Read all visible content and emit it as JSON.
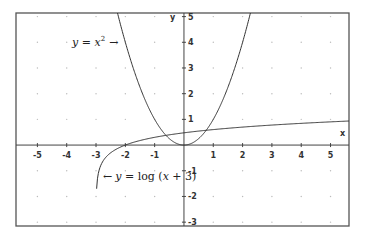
{
  "chart_data": {
    "type": "line",
    "title": "",
    "xlabel": "x",
    "ylabel": "y",
    "xlim": [
      -5.73,
      5.63
    ],
    "ylim": [
      -3.15,
      5.14
    ],
    "grid": "dots",
    "x_ticks": [
      -5,
      -4,
      -3,
      -2,
      -1,
      1,
      2,
      3,
      4,
      5
    ],
    "y_ticks": [
      -3,
      -2,
      -1,
      1,
      2,
      3,
      4,
      5
    ],
    "series": [
      {
        "name": "y = x^2",
        "function": "x^2",
        "domain": [
          -2.27,
          2.27
        ],
        "x": [
          -2.25,
          -2,
          -1.5,
          -1,
          -0.5,
          0,
          0.5,
          1,
          1.5,
          2,
          2.25
        ],
        "values": [
          5.06,
          4,
          2.25,
          1,
          0.25,
          0,
          0.25,
          1,
          2.25,
          4,
          5.06
        ]
      },
      {
        "name": "y = log(x + 3)",
        "function": "log10(x+3)",
        "domain": [
          -2.98,
          5.63
        ],
        "x": [
          -2.98,
          -2.9,
          -2.5,
          -2,
          -1,
          0,
          1,
          2,
          3,
          4,
          5,
          5.63
        ],
        "values": [
          -1.7,
          -1.0,
          -0.3,
          0,
          0.3,
          0.48,
          0.6,
          0.7,
          0.78,
          0.85,
          0.9,
          0.94
        ]
      }
    ],
    "annotations": [
      {
        "text_math": "y = x^2",
        "arrow": "→",
        "position": "upper-left of parabola"
      },
      {
        "text_math": "y = log(x + 3)",
        "arrow": "←",
        "position": "right of log curve asymptote"
      }
    ]
  },
  "labels": {
    "x_axis": "x",
    "y_axis": "y",
    "annot1_y": "y",
    "annot1_eq": " = ",
    "annot1_x": "x",
    "annot1_exp": "2",
    "annot1_arrow": "→",
    "annot2_arrow": "←",
    "annot2_y": "y",
    "annot2_eq": " = log (",
    "annot2_x": "x",
    "annot2_rest": " + 3)"
  },
  "colors": {
    "frame": "#555555",
    "axes": "#444444",
    "curve": "#333333",
    "grid_dot": "#bbbbbb",
    "background": "#ffffff"
  }
}
